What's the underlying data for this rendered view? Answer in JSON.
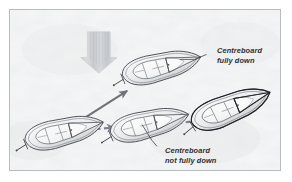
{
  "figure": {
    "background_color": "#dcdee0",
    "border_color": "#b9bcbe",
    "page_color": "#ffffff"
  },
  "annotations": {
    "fully_down": {
      "line1": "Centreboard",
      "line2": "fully down"
    },
    "not_fully_down": {
      "line1": "Centreboard",
      "line2": "not fully down"
    }
  },
  "elements": {
    "wind_arrow": {
      "name": "wind-direction-arrow",
      "direction": "down",
      "style": "striped",
      "color": "#c3c6c9"
    },
    "solid_arrow": {
      "name": "course-arrow-solid",
      "direction": "up-right",
      "color": "#6e737a",
      "style": "solid"
    },
    "dashed_arrow_1": {
      "name": "course-arrow-dashed-1",
      "direction": "right",
      "color": "#7d828a",
      "style": "dashed"
    },
    "dashed_arrow_2": {
      "name": "course-arrow-dashed-2",
      "direction": "right",
      "color": "#7d828a",
      "style": "dashed"
    }
  },
  "boats": [
    {
      "id": "boat-start",
      "label": "Starting dinghy",
      "line_color": "#4a4f55"
    },
    {
      "id": "boat-upper",
      "label": "Dinghy pointing high",
      "line_color": "#4a4f55"
    },
    {
      "id": "boat-middle",
      "label": "Dinghy sliding sideways",
      "line_color": "#4a4f55"
    },
    {
      "id": "boat-right-heeled",
      "label": "Dinghy making leeway",
      "line_color": "#26292d"
    }
  ]
}
